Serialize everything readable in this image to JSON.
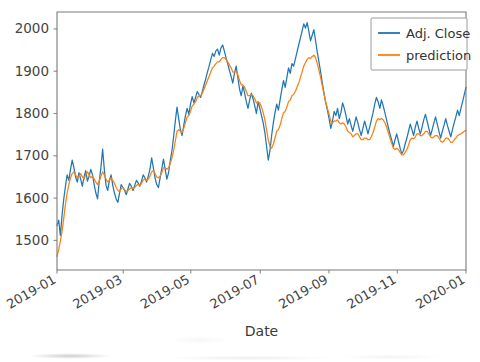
{
  "chart_data": {
    "type": "line",
    "title": "",
    "xlabel": "Date",
    "ylabel": "",
    "grid": false,
    "legend_position": "upper right",
    "ylim": [
      1430,
      2040
    ],
    "xlim": [
      "2019-01-02",
      "2019-12-31"
    ],
    "ytick_labels": [
      "1500",
      "1600",
      "1700",
      "1800",
      "1900",
      "2000"
    ],
    "ytick_values": [
      1500,
      1600,
      1700,
      1800,
      1900,
      2000
    ],
    "xtick_labels": [
      "2019-01",
      "2019-03",
      "2019-05",
      "2019-07",
      "2019-09",
      "2019-11",
      "2020-01"
    ],
    "xtick_positions": [
      0.0,
      0.162,
      0.327,
      0.497,
      0.665,
      0.832,
      1.0
    ],
    "xtick_rotation": 30,
    "colors": {
      "adj_close": "#1f77b4",
      "prediction": "#ff7f0e",
      "axis": "#7a7a7a",
      "text": "#444444",
      "background": "#ffffff"
    },
    "series": [
      {
        "name": "Adj. Close",
        "color": "#1f77b4",
        "values": [
          1535,
          1548,
          1512,
          1560,
          1598,
          1628,
          1655,
          1642,
          1668,
          1690,
          1672,
          1650,
          1638,
          1660,
          1645,
          1628,
          1650,
          1665,
          1640,
          1652,
          1668,
          1655,
          1632,
          1612,
          1598,
          1640,
          1672,
          1716,
          1668,
          1630,
          1618,
          1642,
          1655,
          1630,
          1612,
          1598,
          1590,
          1612,
          1632,
          1625,
          1618,
          1608,
          1622,
          1635,
          1628,
          1618,
          1630,
          1642,
          1636,
          1628,
          1640,
          1655,
          1648,
          1638,
          1652,
          1668,
          1695,
          1672,
          1648,
          1632,
          1625,
          1648,
          1670,
          1692,
          1668,
          1645,
          1660,
          1688,
          1712,
          1745,
          1782,
          1815,
          1788,
          1762,
          1748,
          1772,
          1795,
          1812,
          1798,
          1822,
          1840,
          1825,
          1838,
          1852,
          1845,
          1838,
          1852,
          1868,
          1882,
          1898,
          1912,
          1928,
          1942,
          1935,
          1948,
          1952,
          1938,
          1955,
          1962,
          1948,
          1932,
          1918,
          1902,
          1888,
          1872,
          1895,
          1912,
          1885,
          1858,
          1842,
          1865,
          1848,
          1828,
          1812,
          1832,
          1848,
          1835,
          1818,
          1800,
          1828,
          1812,
          1795,
          1778,
          1755,
          1722,
          1690,
          1712,
          1748,
          1778,
          1802,
          1822,
          1808,
          1832,
          1856,
          1878,
          1862,
          1885,
          1908,
          1895,
          1918,
          1912,
          1928,
          1945,
          1962,
          1978,
          1995,
          2012,
          2002,
          2015,
          1995,
          1972,
          1985,
          1998,
          1972,
          1945,
          1922,
          1898,
          1872,
          1848,
          1825,
          1808,
          1788,
          1765,
          1782,
          1805,
          1795,
          1812,
          1788,
          1802,
          1825,
          1812,
          1795,
          1775,
          1788,
          1772,
          1758,
          1775,
          1792,
          1778,
          1762,
          1748,
          1765,
          1782,
          1768,
          1752,
          1768,
          1785,
          1802,
          1822,
          1838,
          1828,
          1812,
          1832,
          1818,
          1802,
          1785,
          1768,
          1752,
          1738,
          1722,
          1738,
          1752,
          1735,
          1718,
          1705,
          1712,
          1728,
          1742,
          1758,
          1775,
          1762,
          1748,
          1768,
          1782,
          1765,
          1752,
          1768,
          1785,
          1798,
          1782,
          1765,
          1748,
          1762,
          1778,
          1792,
          1775,
          1758,
          1742,
          1758,
          1772,
          1788,
          1772,
          1758,
          1745,
          1762,
          1778,
          1792,
          1808,
          1795,
          1812,
          1828,
          1845,
          1862
        ]
      },
      {
        "name": "prediction",
        "color": "#ff7f0e",
        "values": [
          1462,
          1478,
          1498,
          1522,
          1552,
          1585,
          1612,
          1632,
          1648,
          1658,
          1662,
          1655,
          1648,
          1652,
          1658,
          1650,
          1645,
          1655,
          1662,
          1655,
          1648,
          1652,
          1645,
          1638,
          1632,
          1640,
          1652,
          1662,
          1655,
          1645,
          1638,
          1642,
          1648,
          1642,
          1635,
          1625,
          1618,
          1615,
          1622,
          1625,
          1620,
          1615,
          1618,
          1622,
          1625,
          1622,
          1625,
          1630,
          1632,
          1630,
          1635,
          1642,
          1645,
          1642,
          1645,
          1652,
          1662,
          1665,
          1658,
          1650,
          1648,
          1652,
          1660,
          1672,
          1672,
          1668,
          1672,
          1682,
          1695,
          1712,
          1735,
          1758,
          1762,
          1758,
          1755,
          1765,
          1778,
          1792,
          1795,
          1805,
          1818,
          1822,
          1828,
          1838,
          1842,
          1842,
          1848,
          1858,
          1868,
          1878,
          1888,
          1898,
          1908,
          1912,
          1918,
          1922,
          1922,
          1928,
          1932,
          1932,
          1928,
          1922,
          1915,
          1908,
          1898,
          1898,
          1900,
          1892,
          1878,
          1868,
          1868,
          1862,
          1852,
          1842,
          1842,
          1845,
          1842,
          1835,
          1825,
          1828,
          1825,
          1815,
          1802,
          1785,
          1762,
          1738,
          1722,
          1718,
          1728,
          1742,
          1758,
          1762,
          1772,
          1788,
          1802,
          1805,
          1815,
          1828,
          1832,
          1842,
          1845,
          1852,
          1862,
          1872,
          1885,
          1898,
          1912,
          1920,
          1928,
          1932,
          1930,
          1935,
          1938,
          1932,
          1918,
          1902,
          1885,
          1865,
          1845,
          1828,
          1812,
          1798,
          1782,
          1778,
          1782,
          1782,
          1785,
          1778,
          1775,
          1778,
          1775,
          1768,
          1758,
          1755,
          1752,
          1745,
          1748,
          1752,
          1752,
          1745,
          1738,
          1738,
          1742,
          1742,
          1738,
          1738,
          1745,
          1755,
          1768,
          1782,
          1788,
          1785,
          1788,
          1785,
          1778,
          1768,
          1755,
          1742,
          1730,
          1718,
          1715,
          1718,
          1715,
          1708,
          1702,
          1702,
          1708,
          1715,
          1725,
          1738,
          1742,
          1740,
          1745,
          1752,
          1752,
          1748,
          1748,
          1752,
          1758,
          1758,
          1752,
          1745,
          1742,
          1745,
          1748,
          1748,
          1742,
          1735,
          1732,
          1735,
          1742,
          1742,
          1738,
          1732,
          1732,
          1738,
          1742,
          1748,
          1750,
          1752,
          1755,
          1758,
          1760
        ]
      }
    ]
  },
  "legend": {
    "entries": [
      {
        "label": "Adj. Close",
        "color": "#1f77b4"
      },
      {
        "label": "prediction",
        "color": "#ff7f0e"
      }
    ]
  },
  "axes": {
    "xlabel": "Date",
    "xtick_labels": [
      "2019-01",
      "2019-03",
      "2019-05",
      "2019-07",
      "2019-09",
      "2019-11",
      "2020-01"
    ],
    "ytick_labels": [
      "1500",
      "1600",
      "1700",
      "1800",
      "1900",
      "2000"
    ]
  }
}
